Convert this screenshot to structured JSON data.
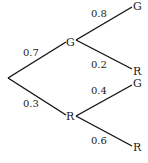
{
  "diagram": {
    "type": "probability-tree",
    "root": {
      "x": 8,
      "y": 78
    },
    "level1": [
      {
        "label": "G",
        "probability": "0.7",
        "children": [
          {
            "label": "G",
            "probability": "0.8"
          },
          {
            "label": "R",
            "probability": "0.2"
          }
        ]
      },
      {
        "label": "R",
        "probability": "0.3",
        "children": [
          {
            "label": "G",
            "probability": "0.4"
          },
          {
            "label": "R",
            "probability": "0.6"
          }
        ]
      }
    ]
  },
  "colors": {
    "line": "#111111",
    "text": "#1a1a1a",
    "background": "#ffffff"
  }
}
